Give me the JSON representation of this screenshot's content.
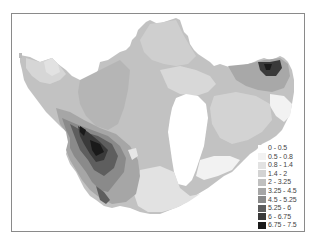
{
  "map": {
    "type": "choropleth",
    "colormap": "grayscale",
    "frame": true
  },
  "legend": {
    "classes": [
      {
        "label": "0 - 0.5",
        "color": "#ffffff"
      },
      {
        "label": "0.5 - 0.8",
        "color": "#f2f2f2"
      },
      {
        "label": "0.8 - 1.4",
        "color": "#e2e2e2"
      },
      {
        "label": "1.4 - 2",
        "color": "#d3d3d3"
      },
      {
        "label": "2 - 3.25",
        "color": "#c0c0c0"
      },
      {
        "label": "3.25 - 4.5",
        "color": "#a6a6a6"
      },
      {
        "label": "4.5 - 5.25",
        "color": "#8a8a8a"
      },
      {
        "label": "5.25 - 6",
        "color": "#5e5e5e"
      },
      {
        "label": "6 - 6.75",
        "color": "#3a3a3a"
      },
      {
        "label": "6.75 - 7.5",
        "color": "#1a1a1a"
      }
    ]
  }
}
